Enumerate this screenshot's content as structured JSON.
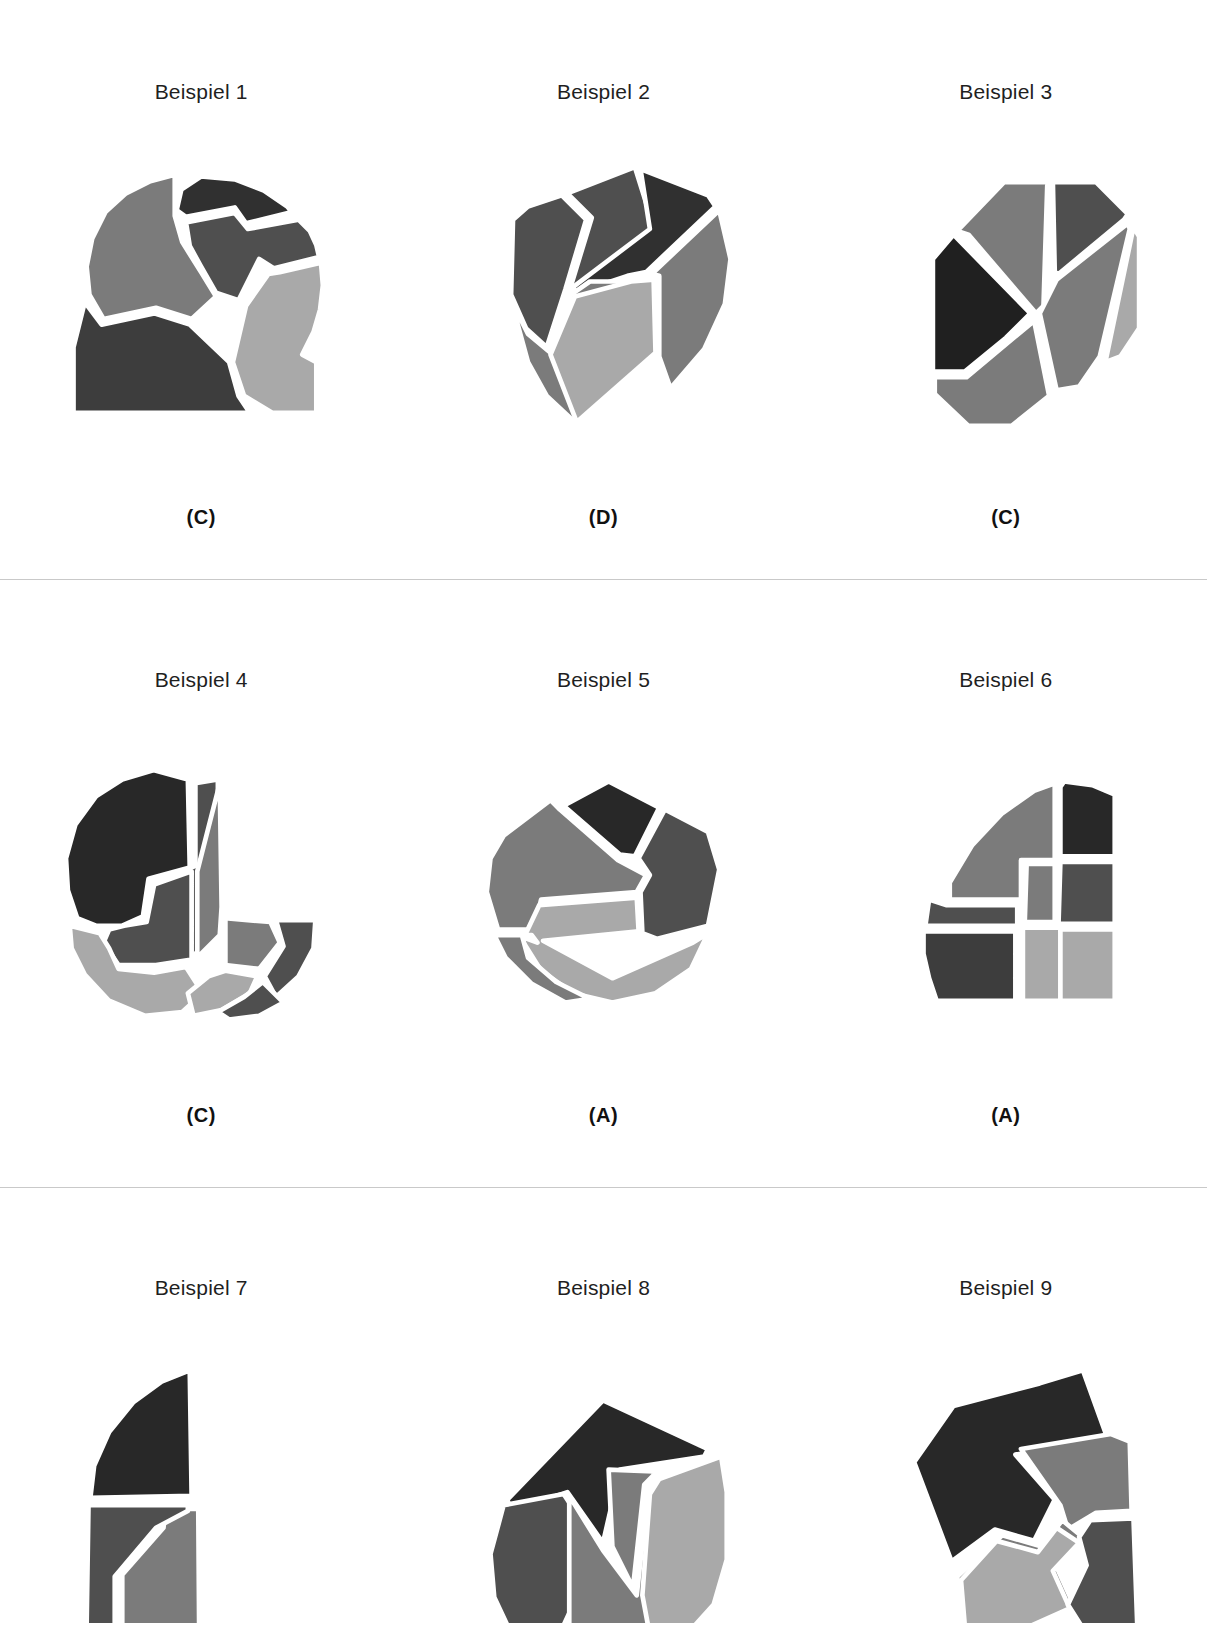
{
  "page": {
    "header_faint_text": "",
    "language": "de",
    "background_color": "#ffffff"
  },
  "palette": {
    "darkest": "#303030",
    "dark": "#3d3d3d",
    "mid_dark": "#4f4f4f",
    "mid": "#7b7b7b",
    "light": "#a9a9a9",
    "separator": "#ffffff",
    "divider_line": "#c9c9c9",
    "text": "#1f1f1f"
  },
  "rows": [
    {
      "cells": [
        {
          "title": "Beispiel 1",
          "answer": "(C)",
          "figure": {
            "name": "quarter-disc-puzzle",
            "outline": "quarter-circle",
            "pieces": [
              {
                "fill": "#303030",
                "points": "160,24 196,27 227,39 252,56 257,62 208,74 196,57 144,67 134,60 139,38"
              },
              {
                "fill": "#4f4f4f",
                "points": "144,73 196,63 210,80 264,70 276,82 283,97 286,110 238,122 222,112 200,156 176,148 160,120 148,98"
              },
              {
                "fill": "#7b7b7b",
                "points": "132,66 140,94 160,126 176,152 150,176 112,164 56,176 41,150 38,120 44,90 58,62 80,42 106,29 132,22"
              },
              {
                "fill": "#a9a9a9",
                "points": "208,162 232,128 244,126 288,116 290,140 287,166 280,190 268,214 283,222 283,276 236,276 206,258 194,222"
              },
              {
                "fill": "#3d3d3d",
                "points": "36,158 54,182 110,170 148,182 190,222 200,258 212,276 24,276 24,206"
              }
            ]
          }
        },
        {
          "title": "Beispiel 2",
          "answer": "(D)",
          "figure": {
            "name": "decagon-puzzle",
            "outline": "decagon",
            "pieces": [
              {
                "fill": "#4f4f4f",
                "points": "122,42 194,14 214,78 130,144 126,140 148,68"
              },
              {
                "fill": "#303030",
                "points": "200,16 272,44 280,56 206,126 186,130 132,148 128,142 210,80"
              },
              {
                "fill": "#4f4f4f",
                "points": "64,70 80,56 116,44 142,70 120,144 100,206 78,186 62,150"
              },
              {
                "fill": "#7b7b7b",
                "points": "62,156 80,192 104,212 126,150 146,136 186,136 212,132 216,214 132,288 100,258 80,222"
              },
              {
                "fill": "#a9a9a9",
                "points": "130,152 190,136 214,134 216,212 132,286 104,214"
              },
              {
                "fill": "#7b7b7b",
                "points": "284,60 296,112 290,160 268,208 232,250 220,216 220,130 212,128"
              }
            ]
          }
        },
        {
          "title": "Beispiel 3",
          "answer": "(C)",
          "figure": {
            "name": "octagon-puzzle",
            "outline": "octagon",
            "pieces": [
              {
                "fill": "#7b7b7b",
                "points": "108,82 158,30 206,30 204,34 200,162 192,170 120,86"
              },
              {
                "fill": "#4f4f4f",
                "points": "210,30 256,30 290,64 286,70 216,128 212,126"
              },
              {
                "fill": "#202020",
                "points": "104,86 186,170 160,196 116,232 82,232 82,112"
              },
              {
                "fill": "#7b7b7b",
                "points": "196,170 214,134 290,74 292,80 260,216 238,248 214,252"
              },
              {
                "fill": "#7b7b7b",
                "points": "190,178 118,238 84,238 84,256 120,290 166,290 206,258"
              },
              {
                "fill": "#a9a9a9",
                "points": "296,78 302,88 302,186 282,216 266,222"
              }
            ]
          }
        }
      ]
    },
    {
      "cells": [
        {
          "title": "Beispiel 4",
          "answer": "(C)",
          "figure": {
            "name": "pacman-disc-puzzle",
            "outline": "circle-with-notch",
            "pieces": [
              {
                "fill": "#282828",
                "points": "146,40 148,134 104,146 98,186 76,196 48,196 28,188 18,158 16,124 26,88 48,58 76,40 110,30"
              },
              {
                "fill": "#4f4f4f",
                "points": "154,44 154,132 112,150 106,188 82,200 100,226 152,228 178,200 178,40"
              },
              {
                "fill": "#7b7b7b",
                "points": "156,138 156,230 180,206 182,176 180,44"
              },
              {
                "fill": "#4f4f4f",
                "points": "110,152 150,138 150,232 112,238 72,238 56,214 62,200 78,196 102,192"
              },
              {
                "fill": "#a9a9a9",
                "points": "20,196 52,204 62,220 72,242 110,246 144,240 162,268 140,288 100,292 62,276 36,248 22,220"
              },
              {
                "fill": "#7b7b7b",
                "points": "186,188 234,192 244,214 222,242 186,238"
              },
              {
                "fill": "#4f4f4f",
                "points": "240,190 282,190 280,220 264,250 240,272 228,250 248,218"
              },
              {
                "fill": "#a9a9a9",
                "points": "168,250 186,244 220,250 212,268 182,286 152,292 146,268"
              },
              {
                "fill": "#4f4f4f",
                "points": "226,256 248,278 222,292 190,296 178,288 206,272"
              }
            ]
          }
        },
        {
          "title": "Beispiel 5",
          "answer": "(A)",
          "figure": {
            "name": "nonagon-zigzag-puzzle",
            "outline": "nonagon",
            "pieces": [
              {
                "fill": "#282828",
                "points": "118,68 166,42 220,70 194,122 178,120"
              },
              {
                "fill": "#7b7b7b",
                "points": "54,100 104,62 114,72 176,126 206,142 196,160 94,168 86,200 48,200 36,160 40,124"
              },
              {
                "fill": "#4f4f4f",
                "points": "226,72 272,96 284,136 272,196 218,210 202,204 200,160 210,142 198,124"
              },
              {
                "fill": "#a9a9a9",
                "points": "92,174 196,166 198,202 96,212 170,252 256,214 272,204 254,242 216,268 170,278 128,268 94,244 74,212"
              },
              {
                "fill": "#7b7b7b",
                "points": "44,206 84,206 90,214 74,208 80,230 110,256 146,274 120,278 84,258 56,230"
              }
            ]
          }
        },
        {
          "title": "Beispiel 6",
          "answer": "(A)",
          "figure": {
            "name": "quarter-disc-puzzle-2",
            "outline": "quarter-circle",
            "pieces": [
              {
                "fill": "#282828",
                "points": "222,42 252,46 276,56 276,122 218,122 218,48"
              },
              {
                "fill": "#7b7b7b",
                "points": "100,150 124,110 156,76 190,52 212,44 212,126 176,126 176,168 100,168"
              },
              {
                "fill": "#4f4f4f",
                "points": "218,128 276,128 276,194 216,194"
              },
              {
                "fill": "#7b7b7b",
                "points": "182,130 212,130 212,192 180,192"
              },
              {
                "fill": "#4f4f4f",
                "points": "74,196 78,168 96,174 172,174 172,196"
              },
              {
                "fill": "#3d3d3d",
                "points": "72,202 170,202 170,276 86,276 78,252 72,226"
              },
              {
                "fill": "#a9a9a9",
                "points": "178,198 276,198 276,276 178,276"
              },
              {
                "fill": "#a9a9a9",
                "points": "218,200 276,200 276,276 218,276"
              }
            ]
          }
        }
      ]
    },
    {
      "cells": [
        {
          "title": "Beispiel 7",
          "answer": "",
          "figure": {
            "name": "quarter-disc-puzzle-3",
            "outline": "quarter-circle-partial",
            "pieces": [
              {
                "fill": "#282828",
                "points": "148,28 150,162 42,164 46,130 62,94 88,62 118,40"
              },
              {
                "fill": "#7b7b7b",
                "points": "156,26 158,300 76,300 76,246 120,196 122,176 156,176"
              },
              {
                "fill": "#4f4f4f",
                "points": "40,172 146,172 146,178 112,196 68,248 68,300 38,300"
              }
            ]
          }
        },
        {
          "title": "Beispiel 8",
          "answer": "",
          "figure": {
            "name": "heptagon-arrow-puzzle",
            "outline": "heptagon",
            "pieces": [
              {
                "fill": "#282828",
                "points": "160,60 272,112 268,120 178,134 160,212 122,158 62,178 58,166"
              },
              {
                "fill": "#4f4f4f",
                "points": "54,172 118,160 156,218 118,300 58,300 44,270 40,224"
              },
              {
                "fill": "#7b7b7b",
                "points": "166,134 170,216 192,260 204,150 214,140 214,136"
              },
              {
                "fill": "#7b7b7b",
                "points": "124,162 160,220 196,268 208,158 218,146 284,122 292,160 292,230 278,276 258,300 124,300"
              },
              {
                "fill": "#a9a9a9",
                "points": "220,144 286,120 292,158 292,230 278,278 258,300 208,300 202,268 210,160"
              }
            ]
          }
        },
        {
          "title": "Beispiel 9",
          "answer": "",
          "figure": {
            "name": "irregular-puzzle",
            "outline": "irregular-polygon",
            "pieces": [
              {
                "fill": "#282828",
                "points": "196,42 242,28 268,100 170,118 212,166 190,210 148,198 102,232 62,126 104,66"
              },
              {
                "fill": "#7b7b7b",
                "points": "176,112 272,96 292,104 294,178 256,180 226,198 218,172"
              },
              {
                "fill": "#7b7b7b",
                "points": "156,204 198,216 220,188 242,206 214,238 232,278 190,300 112,300 108,248"
              },
              {
                "fill": "#a9a9a9",
                "points": "150,210 194,222 214,196 238,212 210,242 228,282 188,300 116,300 112,252"
              },
              {
                "fill": "#4f4f4f",
                "points": "250,188 296,186 300,300 240,300 226,278 246,236 238,206"
              }
            ]
          }
        }
      ]
    }
  ]
}
